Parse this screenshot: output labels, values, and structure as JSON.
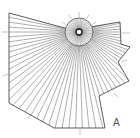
{
  "figure": {
    "label": "A",
    "center": [
      79,
      32
    ],
    "outer_radius": 14,
    "inner_radius": 3,
    "ray_count": 90,
    "line_color": "#4a4a4a",
    "polygon": [
      [
        9,
        13
      ],
      [
        72,
        30
      ],
      [
        120,
        22
      ],
      [
        121,
        44
      ],
      [
        130,
        47
      ],
      [
        118,
        62
      ],
      [
        129,
        81
      ],
      [
        99,
        96
      ],
      [
        105,
        128
      ],
      [
        54,
        128
      ],
      [
        9,
        103
      ]
    ],
    "ticks": [
      {
        "x1": 2,
        "y1": 32,
        "x2": 10,
        "y2": 32
      },
      {
        "x1": 120,
        "y1": 33,
        "x2": 130,
        "y2": 33
      },
      {
        "x1": 3,
        "y1": 76,
        "x2": 8,
        "y2": 74
      },
      {
        "x1": 28,
        "y1": 118,
        "x2": 31,
        "y2": 114
      },
      {
        "x1": 80,
        "y1": 128,
        "x2": 80,
        "y2": 135
      },
      {
        "x1": 121,
        "y1": 62,
        "x2": 127,
        "y2": 60
      },
      {
        "x1": 114,
        "y1": 93,
        "x2": 118,
        "y2": 97
      }
    ]
  }
}
